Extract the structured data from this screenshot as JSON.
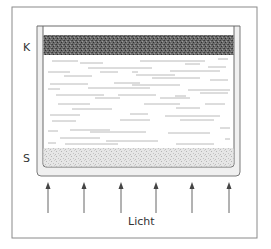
{
  "diagram": {
    "labels": {
      "top_layer": "K",
      "bottom_layer": "S",
      "light": "Licht"
    },
    "arrow_count": 6,
    "colors": {
      "frame": "#888888",
      "container": "#777777",
      "dark_layer": "#555555",
      "sediment": "#d8d8d8",
      "water_lines": "#aaaaaa",
      "arrows": "#555555"
    }
  }
}
